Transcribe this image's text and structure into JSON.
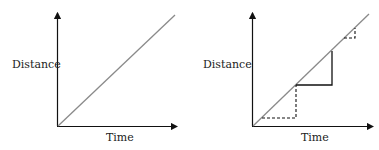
{
  "left_graph": {
    "y_label": "Distance",
    "x_label": "Time"
  },
  "right_graph": {
    "y_label": "Distance",
    "x_label": "Time"
  },
  "colors": {
    "axis": "#111111",
    "line": "#8a8a8a",
    "steps": "#111111"
  }
}
